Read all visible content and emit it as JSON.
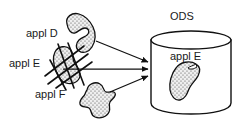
{
  "diagram": {
    "type": "data-consolidation-flow",
    "title_visible": "ODS",
    "colors": {
      "stroke": "#1a1a1a",
      "text": "#1a1a1a",
      "blob_fill": "#e8e8e8",
      "blob_stipple": "#555555",
      "background": "#ffffff"
    },
    "sources": [
      {
        "id": "appl-d",
        "label": "appl D",
        "label_x": 26,
        "label_y": 28,
        "shape": "crescent-blob",
        "struck_out": false
      },
      {
        "id": "appl-e",
        "label": "appl E",
        "label_x": 9,
        "label_y": 58,
        "shape": "lobed-blob",
        "struck_out": true
      },
      {
        "id": "appl-f",
        "label": "appl F",
        "label_x": 35,
        "label_y": 89,
        "shape": "amoeba-blob",
        "struck_out": false
      }
    ],
    "target": {
      "id": "ods-cylinder",
      "title": "ODS",
      "title_x": 170,
      "title_y": 11,
      "content_label": "appl E",
      "content_label_x": 170,
      "content_label_y": 52,
      "shape": "cylinder"
    },
    "arrows": [
      {
        "id": "arrow-appl-d",
        "from": "appl D",
        "to": "ODS"
      },
      {
        "id": "arrow-appl-e",
        "from": "appl E",
        "to": "ODS"
      },
      {
        "id": "arrow-appl-f",
        "from": "appl F",
        "to": "ODS"
      }
    ]
  }
}
